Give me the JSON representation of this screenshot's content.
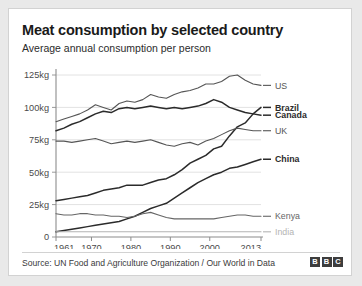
{
  "header": {
    "title": "Meat consumption by selected country",
    "subtitle": "Average annual consumption per person"
  },
  "footer": {
    "source": "Source: UN Food and Agriculture Organization / Our World in Data",
    "logo_letters": [
      "B",
      "B",
      "C"
    ]
  },
  "chart_data": {
    "type": "line",
    "title": "Meat consumption by selected country",
    "subtitle": "Average annual consumption per person",
    "xlabel": "",
    "ylabel": "",
    "xlim": [
      1961,
      2013
    ],
    "ylim": [
      0,
      125
    ],
    "grid": "horizontal",
    "legend_position": "right-inline",
    "y_ticks": [
      0,
      25,
      50,
      75,
      100,
      125
    ],
    "y_tick_labels": [
      "0",
      "25kg",
      "50kg",
      "75kg",
      "100kg",
      "125kg"
    ],
    "x_ticks": [
      1961,
      1970,
      1980,
      1990,
      2000,
      2013
    ],
    "x_tick_labels": [
      "1961",
      "1970",
      "1980",
      "1990",
      "2000",
      "2013"
    ],
    "units": "kg per person per year",
    "series": [
      {
        "name": "US",
        "label": "US",
        "color": "#555555",
        "bold": false,
        "label_value": 117,
        "x": [
          1961,
          1963,
          1965,
          1967,
          1969,
          1971,
          1973,
          1975,
          1977,
          1979,
          1981,
          1983,
          1985,
          1987,
          1989,
          1991,
          1993,
          1995,
          1997,
          1999,
          2001,
          2003,
          2005,
          2007,
          2009,
          2011,
          2013
        ],
        "values": [
          89,
          91,
          93,
          95,
          98,
          102,
          100,
          98,
          103,
          105,
          104,
          106,
          110,
          108,
          107,
          110,
          112,
          113,
          115,
          118,
          118,
          120,
          124,
          125,
          121,
          118,
          117
        ]
      },
      {
        "name": "Brazil",
        "label": "Brazil",
        "color": "#2b2b2b",
        "bold": true,
        "label_value": 100,
        "x": [
          1961,
          1963,
          1965,
          1967,
          1969,
          1971,
          1973,
          1975,
          1977,
          1979,
          1981,
          1983,
          1985,
          1987,
          1989,
          1991,
          1993,
          1995,
          1997,
          1999,
          2001,
          2003,
          2005,
          2007,
          2009,
          2011,
          2013
        ],
        "values": [
          28,
          29,
          30,
          31,
          32,
          34,
          36,
          37,
          38,
          40,
          40,
          40,
          42,
          44,
          45,
          48,
          52,
          57,
          60,
          63,
          68,
          70,
          78,
          85,
          88,
          95,
          100
        ]
      },
      {
        "name": "Canada",
        "label": "Canada",
        "color": "#2b2b2b",
        "bold": true,
        "label_value": 94,
        "x": [
          1961,
          1963,
          1965,
          1967,
          1969,
          1971,
          1973,
          1975,
          1977,
          1979,
          1981,
          1983,
          1985,
          1987,
          1989,
          1991,
          1993,
          1995,
          1997,
          1999,
          2001,
          2003,
          2005,
          2007,
          2009,
          2011,
          2013
        ],
        "values": [
          82,
          84,
          87,
          89,
          92,
          95,
          97,
          96,
          99,
          100,
          99,
          100,
          101,
          100,
          99,
          100,
          99,
          100,
          101,
          103,
          106,
          104,
          100,
          98,
          96,
          95,
          94
        ]
      },
      {
        "name": "UK",
        "label": "UK",
        "color": "#555555",
        "bold": false,
        "label_value": 82,
        "x": [
          1961,
          1963,
          1965,
          1967,
          1969,
          1971,
          1973,
          1975,
          1977,
          1979,
          1981,
          1983,
          1985,
          1987,
          1989,
          1991,
          1993,
          1995,
          1997,
          1999,
          2001,
          2003,
          2005,
          2007,
          2009,
          2011,
          2013
        ],
        "values": [
          74,
          74,
          73,
          74,
          75,
          76,
          74,
          72,
          73,
          74,
          73,
          74,
          75,
          73,
          71,
          70,
          72,
          73,
          71,
          74,
          76,
          79,
          82,
          84,
          83,
          82,
          82
        ]
      },
      {
        "name": "China",
        "label": "China",
        "color": "#2b2b2b",
        "bold": true,
        "label_value": 60,
        "x": [
          1961,
          1963,
          1965,
          1967,
          1969,
          1971,
          1973,
          1975,
          1977,
          1979,
          1981,
          1983,
          1985,
          1987,
          1989,
          1991,
          1993,
          1995,
          1997,
          1999,
          2001,
          2003,
          2005,
          2007,
          2009,
          2011,
          2013
        ],
        "values": [
          4,
          5,
          6,
          7,
          8,
          9,
          10,
          11,
          12,
          14,
          16,
          19,
          22,
          24,
          26,
          30,
          34,
          38,
          42,
          45,
          48,
          50,
          53,
          54,
          56,
          58,
          60
        ]
      },
      {
        "name": "Kenya",
        "label": "Kenya",
        "color": "#666666",
        "bold": false,
        "label_value": 16,
        "x": [
          1961,
          1963,
          1965,
          1967,
          1969,
          1971,
          1973,
          1975,
          1977,
          1979,
          1981,
          1983,
          1985,
          1987,
          1989,
          1991,
          1993,
          1995,
          1997,
          1999,
          2001,
          2003,
          2005,
          2007,
          2009,
          2011,
          2013
        ],
        "values": [
          18,
          17,
          17,
          18,
          18,
          17,
          17,
          16,
          16,
          15,
          16,
          18,
          19,
          17,
          15,
          14,
          14,
          14,
          14,
          14,
          14,
          15,
          16,
          17,
          17,
          16,
          16
        ]
      },
      {
        "name": "India",
        "label": "India",
        "color": "#b4b4b4",
        "bold": false,
        "label_value": 4,
        "x": [
          1961,
          1963,
          1965,
          1967,
          1969,
          1971,
          1973,
          1975,
          1977,
          1979,
          1981,
          1983,
          1985,
          1987,
          1989,
          1991,
          1993,
          1995,
          1997,
          1999,
          2001,
          2003,
          2005,
          2007,
          2009,
          2011,
          2013
        ],
        "values": [
          4,
          4,
          4,
          4,
          4,
          4,
          4,
          4,
          4,
          4,
          4,
          4,
          4,
          4,
          4,
          4,
          4,
          4,
          4,
          4,
          4,
          4,
          4,
          4,
          4,
          4,
          4
        ]
      }
    ]
  }
}
